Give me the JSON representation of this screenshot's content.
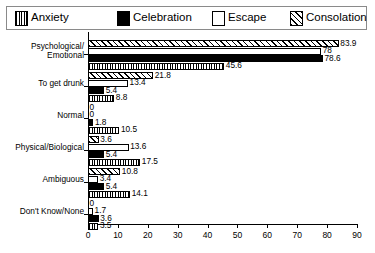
{
  "legend": {
    "items": [
      {
        "label": "Anxiety",
        "pattern": "vertical-stripes",
        "color": "#000000"
      },
      {
        "label": "Celebration",
        "pattern": "solid-black",
        "color": "#000000"
      },
      {
        "label": "Escape",
        "pattern": "white",
        "color": "#ffffff"
      },
      {
        "label": "Consolation",
        "pattern": "diagonal-hatch",
        "color": "#000000"
      }
    ]
  },
  "chart_data": {
    "type": "bar",
    "orientation": "horizontal",
    "title": "",
    "xlabel": "",
    "ylabel": "",
    "xlim": [
      0,
      90
    ],
    "xticks": [
      0,
      10,
      20,
      30,
      40,
      50,
      60,
      70,
      80,
      90
    ],
    "grid": false,
    "legend_position": "top",
    "categories": [
      "Psychological/\nEmotional",
      "To get drunk",
      "Normal",
      "Physical/Biological",
      "Ambiguous",
      "Don't Know/None"
    ],
    "series": [
      {
        "name": "Anxiety",
        "values": [
          45.6,
          8.8,
          10.5,
          17.5,
          14.1,
          3.5
        ]
      },
      {
        "name": "Celebration",
        "values": [
          78.6,
          5.4,
          1.8,
          5.4,
          5.4,
          3.6
        ]
      },
      {
        "name": "Escape",
        "values": [
          78.0,
          13.4,
          0,
          13.6,
          3.4,
          1.7
        ]
      },
      {
        "name": "Consolation",
        "values": [
          83.9,
          21.8,
          0,
          3.6,
          10.8,
          0
        ]
      }
    ]
  }
}
